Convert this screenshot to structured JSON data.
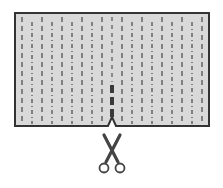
{
  "diagram": {
    "colors": {
      "background": "#ffffff",
      "sheet_fill": "#d9d9d9",
      "sheet_border": "#333333",
      "dash_lines": "#6a6a6a",
      "highlight_cut": "#3a3a3a",
      "scissors": "#444444"
    },
    "sheet": {
      "x": 15,
      "y": 13,
      "width": 194,
      "height": 113
    },
    "line_count": 19,
    "line_spacing": 10,
    "first_line_x": 22,
    "highlighted_line_x": 112,
    "highlighted_dashes": [
      {
        "y": 85,
        "h": 8
      },
      {
        "y": 97,
        "h": 8
      },
      {
        "y": 109,
        "h": 8
      }
    ],
    "notch": {
      "x": 112,
      "width": 8,
      "depth": 9
    },
    "icons": [
      "scissors-icon"
    ]
  }
}
